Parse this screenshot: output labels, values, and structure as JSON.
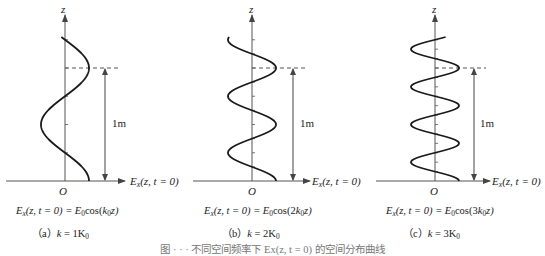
{
  "figure": {
    "caption_partial": "图 · · · 不同空间频率下 Ex(z, t = 0) 的空间分布曲线",
    "panels": [
      {
        "id": "a",
        "axis_z_label": "z",
        "axis_x_label_main": "E",
        "axis_x_label_sub": "x",
        "axis_x_label_rest": "(z, t = 0)",
        "origin_label": "O",
        "length_label": "1m",
        "formula_lhs_main": "E",
        "formula_lhs_sub": "x",
        "formula_lhs_rest": "(z, t = 0) = ",
        "formula_rhs_main": "E",
        "formula_rhs_sub": "0",
        "formula_rhs_rest_pre": "cos(",
        "formula_rhs_k": "k",
        "formula_rhs_k_sub": "0",
        "formula_rhs_rest_post": "z)",
        "formula_coef": "",
        "caption_prefix": "（a）",
        "caption_k": "k",
        "caption_eq": " = 1K",
        "caption_sub": "0",
        "periods_per_meter": 1
      },
      {
        "id": "b",
        "axis_z_label": "z",
        "axis_x_label_main": "E",
        "axis_x_label_sub": "x",
        "axis_x_label_rest": "(z, t = 0)",
        "origin_label": "O",
        "length_label": "1m",
        "formula_lhs_main": "E",
        "formula_lhs_sub": "x",
        "formula_lhs_rest": "(z, t = 0) = ",
        "formula_rhs_main": "E",
        "formula_rhs_sub": "0",
        "formula_rhs_rest_pre": "cos(2",
        "formula_rhs_k": "k",
        "formula_rhs_k_sub": "0",
        "formula_rhs_rest_post": "z)",
        "caption_prefix": "（b）",
        "caption_k": "k",
        "caption_eq": " = 2K",
        "caption_sub": "0",
        "periods_per_meter": 2
      },
      {
        "id": "c",
        "axis_z_label": "z",
        "axis_x_label_main": "E",
        "axis_x_label_sub": "x",
        "axis_x_label_rest": "(z, t = 0)",
        "origin_label": "O",
        "length_label": "1m",
        "formula_lhs_main": "E",
        "formula_lhs_sub": "x",
        "formula_lhs_rest": "(z, t = 0) = ",
        "formula_rhs_main": "E",
        "formula_rhs_sub": "0",
        "formula_rhs_rest_pre": "cos(3",
        "formula_rhs_k": "k",
        "formula_rhs_k_sub": "0",
        "formula_rhs_rest_post": "z)",
        "caption_prefix": "（c）",
        "caption_k": "k",
        "caption_eq": " = 3K",
        "caption_sub": "0",
        "periods_per_meter": 3
      }
    ]
  },
  "colors": {
    "curve": "#1a1a1a",
    "axis": "#555555",
    "dashed": "#555555",
    "text": "#222222"
  }
}
